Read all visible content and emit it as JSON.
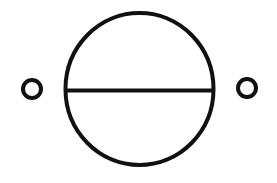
{
  "diagram": {
    "type": "electrical-symbol",
    "colors": {
      "stroke": "#111111",
      "background": "#ffffff"
    },
    "main_circle": {
      "cx": 139.5,
      "cy": 89,
      "rx": 74,
      "ry": 76,
      "stroke_width": 4
    },
    "divider_line": {
      "x1": 67,
      "x2": 212,
      "y": 90.5,
      "stroke_width": 4
    },
    "terminals": [
      {
        "name": "left-terminal",
        "cx": 32,
        "cy": 89,
        "r": 9,
        "stroke_width": 4
      },
      {
        "name": "right-terminal",
        "cx": 247,
        "cy": 88,
        "r": 9,
        "stroke_width": 4
      }
    ]
  }
}
